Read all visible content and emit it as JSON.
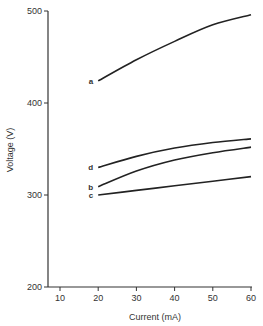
{
  "chart_data": {
    "type": "line",
    "title": "",
    "xlabel": "Current (mA)",
    "ylabel": "Voltage (V)",
    "xlim": [
      7,
      60
    ],
    "ylim": [
      200,
      500
    ],
    "xticks": [
      10,
      20,
      30,
      40,
      50,
      60
    ],
    "yticks": [
      200,
      300,
      400,
      500
    ],
    "grid": false,
    "legend": "inline labels at left end of each curve",
    "series": [
      {
        "name": "a",
        "x": [
          20,
          30,
          40,
          50,
          60
        ],
        "values": [
          424,
          447,
          467,
          485,
          496
        ]
      },
      {
        "name": "b",
        "x": [
          20,
          30,
          40,
          50,
          60
        ],
        "values": [
          309,
          326,
          338,
          346,
          352
        ]
      },
      {
        "name": "c",
        "x": [
          20,
          30,
          40,
          50,
          60
        ],
        "values": [
          300,
          305,
          310,
          315,
          320
        ]
      },
      {
        "name": "d",
        "x": [
          20,
          30,
          40,
          50,
          60
        ],
        "values": [
          330,
          342,
          351,
          357,
          361
        ]
      }
    ]
  },
  "colors": {
    "line": "#222222",
    "axis": "#333333"
  }
}
